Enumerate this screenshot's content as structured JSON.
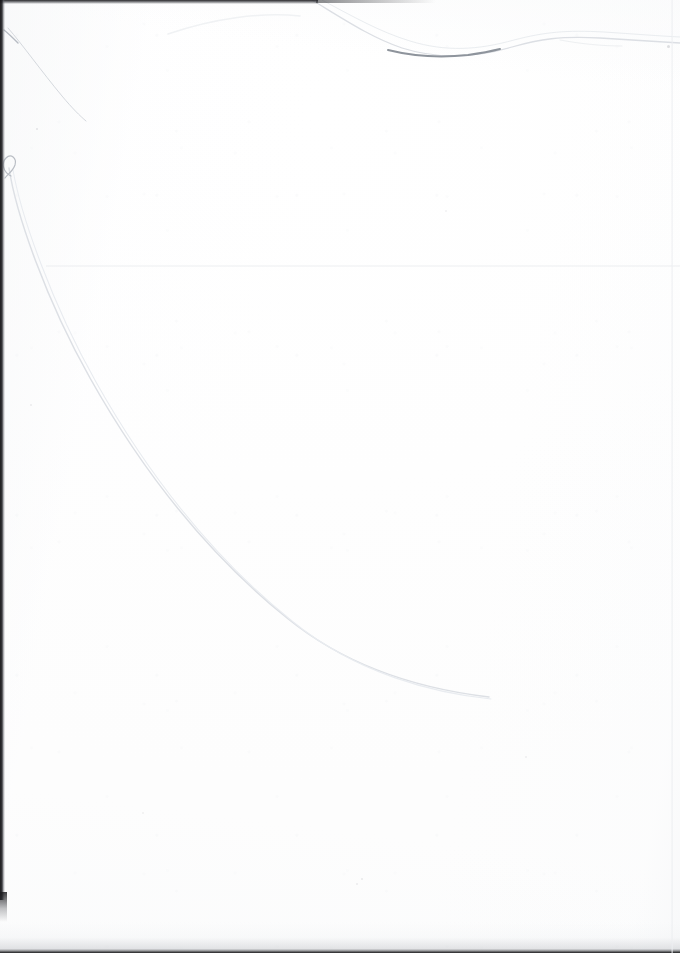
{
  "document": {
    "type": "scanned-page",
    "title": "Scanned blank page",
    "page_label": "",
    "text_content": "",
    "visible_text": [],
    "width_px": 680,
    "height_px": 953
  },
  "colors": {
    "paper": "#ffffff",
    "paper_shadow": "#f4f5f7",
    "scan_edge_dark": "#16161a",
    "scan_edge_mid": "#3a3c42",
    "pencil_line": "#d9dde2",
    "pencil_line_faint": "#eceff2",
    "ink_dark": "#9aa0a8",
    "crease": "#e9ebee",
    "speck": "#96989e"
  },
  "artifacts": {
    "edges": [
      {
        "name": "left-scan-edge",
        "x": 0,
        "y": 0,
        "width": 5,
        "height": 900
      },
      {
        "name": "left-scan-edge-fade",
        "x": 0,
        "y": 892,
        "width": 7,
        "height": 30
      },
      {
        "name": "top-scan-edge",
        "x": 0,
        "y": 0,
        "width": 318,
        "height": 4
      },
      {
        "name": "top-scan-edge-taper",
        "x": 316,
        "y": 0,
        "width": 120,
        "height": 3
      },
      {
        "name": "bottom-scan-edge",
        "x": 0,
        "y": 949,
        "width": 680,
        "height": 4
      },
      {
        "name": "bottom-scan-shade",
        "x": 0,
        "y": 922,
        "width": 680,
        "height": 28
      },
      {
        "name": "right-scan-seam",
        "x": 671,
        "y": 0,
        "width": 2,
        "height": 953
      }
    ],
    "crease": {
      "name": "horizontal-fold-crease",
      "x": 46,
      "y": 265,
      "width": 634,
      "height": 2
    },
    "curves": [
      {
        "name": "main-pencil-curve",
        "description": "long faint hair/pencil arc sweeping from upper-left hook down to the right, tapering out",
        "path": "M 9,168 C 16,214 46,300 90,378 C 140,467 205,552 287,618 C 352,671 430,690 489,697",
        "stroke": "#dde0e5",
        "stroke_width": 1.5
      },
      {
        "name": "main-pencil-curve-shadow",
        "description": "secondary parallel hairline slightly offset from the main curve",
        "path": "M 13,170 C 21,216 52,304 96,382 C 146,471 211,556 292,621 C 357,674 434,693 491,699",
        "stroke": "#e9ecf0",
        "stroke_width": 1.1
      },
      {
        "name": "curve-start-hook",
        "description": "small looped hook where the faint line begins near the left edge",
        "path": "M 11,176 C 3,172 1,163 6,158 C 11,153 17,158 15,165 C 13,171 8,174 5,178",
        "stroke": "#b9bdc4",
        "stroke_width": 1.2
      },
      {
        "name": "top-edge-thread",
        "description": "thin thread/line running along the top edge, dipping then rising to the right",
        "path": "M 312,0 C 345,20 372,38 402,48 C 440,60 475,58 512,47 C 540,39 560,36 600,38 C 632,40 660,42 680,43",
        "stroke": "#dcdfe4",
        "stroke_width": 1.3
      },
      {
        "name": "top-edge-thread-upper",
        "description": "companion hairline just above the top thread",
        "path": "M 322,0 C 352,16 380,32 410,41 C 446,52 478,50 514,40 C 545,32 566,30 604,32 C 634,34 660,36 680,37",
        "stroke": "#eaedf0",
        "stroke_width": 1.0
      },
      {
        "name": "top-ink-smudge",
        "description": "darker textured ink segment along the top thread",
        "path": "M 388,50 C 412,56 440,58 468,55 C 482,53 492,51 500,49",
        "stroke": "#8e949c",
        "stroke_width": 2.0
      },
      {
        "name": "corner-scratch",
        "description": "faint diagonal scratch in the upper-left corner",
        "path": "M 8,28 C 22,44 42,72 62,96 C 72,108 80,116 86,121",
        "stroke": "#d5d9de",
        "stroke_width": 1.0
      },
      {
        "name": "corner-scratch-short",
        "description": "short tick near the upper-left scratch",
        "path": "M 4,30 C 9,34 14,39 18,43",
        "stroke": "#b7bcc3",
        "stroke_width": 1.4
      },
      {
        "name": "top-soft-arc",
        "description": "very soft broad arc across the top area of the sheet",
        "path": "M 168,34 C 215,18 262,12 300,16",
        "stroke": "#f0f2f4",
        "stroke_width": 1.6
      },
      {
        "name": "top-right-whisker",
        "description": "faint short stroke near the top right",
        "path": "M 560,40 C 582,44 602,46 622,46",
        "stroke": "#eef0f2",
        "stroke_width": 1.0
      }
    ],
    "specks": [
      {
        "name": "speck-top-right",
        "x": 667,
        "y": 45,
        "size": 3,
        "opacity": 0.55
      },
      {
        "name": "speck-upper-left",
        "x": 36,
        "y": 128,
        "size": 2,
        "opacity": 0.4
      },
      {
        "name": "speck-mid-left",
        "x": 30,
        "y": 404,
        "size": 2,
        "opacity": 0.3
      },
      {
        "name": "speck-center",
        "x": 361,
        "y": 878,
        "size": 2,
        "opacity": 0.35
      },
      {
        "name": "speck-lower-center",
        "x": 356,
        "y": 883,
        "size": 2,
        "opacity": 0.3
      },
      {
        "name": "speck-right-mid",
        "x": 525,
        "y": 756,
        "size": 2,
        "opacity": 0.25
      },
      {
        "name": "speck-upper-right",
        "x": 445,
        "y": 210,
        "size": 2,
        "opacity": 0.22
      },
      {
        "name": "speck-lower-left",
        "x": 142,
        "y": 812,
        "size": 2,
        "opacity": 0.24
      }
    ]
  }
}
